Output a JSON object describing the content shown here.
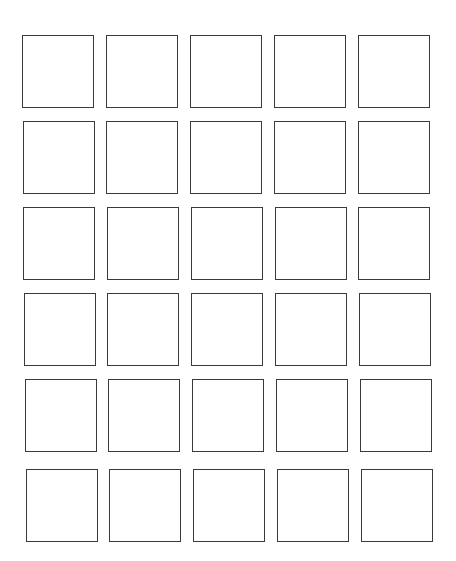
{
  "page": {
    "background": "#ffffff",
    "box_border_color": "#3a3a3a"
  },
  "grid": {
    "rows": 6,
    "columns": 5,
    "box_width": 72,
    "box_height": 73,
    "rows_layout": [
      {
        "top": 35,
        "lefts": [
          22,
          106,
          190,
          274,
          358
        ]
      },
      {
        "top": 121,
        "lefts": [
          23,
          106,
          190,
          274,
          358
        ]
      },
      {
        "top": 207,
        "lefts": [
          23,
          107,
          191,
          275,
          358
        ]
      },
      {
        "top": 293,
        "lefts": [
          24,
          107,
          191,
          275,
          359
        ]
      },
      {
        "top": 379,
        "lefts": [
          25,
          108,
          192,
          276,
          360
        ]
      },
      {
        "top": 469,
        "lefts": [
          26,
          109,
          193,
          277,
          361
        ]
      }
    ]
  }
}
